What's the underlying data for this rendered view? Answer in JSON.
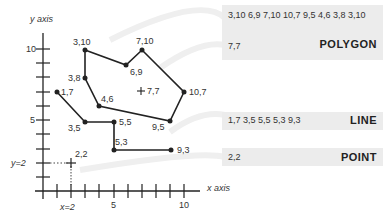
{
  "axes": {
    "x_label": "x axis",
    "y_label": "y axis",
    "x_ticks": [
      "5",
      "10"
    ],
    "y_ticks": [
      "5",
      "10"
    ],
    "x_guide_label": "x=2",
    "y_guide_label": "y=2"
  },
  "polygon": {
    "vertices": [
      [
        3,
        10
      ],
      [
        6,
        9
      ],
      [
        7,
        10
      ],
      [
        10,
        7
      ],
      [
        9,
        5
      ],
      [
        4,
        6
      ],
      [
        3,
        8
      ],
      [
        3,
        10
      ]
    ],
    "vertex_labels": [
      "3,10",
      "6,9",
      "7,10",
      "10,7",
      "9,5",
      "4,6",
      "3,8"
    ],
    "centroid": [
      7,
      7
    ],
    "centroid_label": "7,7",
    "panel": {
      "coords": "3,10 6,9 7,10 10,7 9,5 4,6 3,8 3,10",
      "centroid": "7,7",
      "title": "POLYGON"
    }
  },
  "line": {
    "vertices": [
      [
        1,
        7
      ],
      [
        3,
        5
      ],
      [
        5,
        5
      ],
      [
        5,
        3
      ],
      [
        9,
        3
      ]
    ],
    "vertex_labels": [
      "1,7",
      "3,5",
      "5,5",
      "5,3",
      "9,3"
    ],
    "panel": {
      "coords": "1,7 3,5 5,5 5,3 9,3",
      "title": "LINE"
    }
  },
  "point": {
    "location": [
      2,
      2
    ],
    "label": "2,2",
    "panel": {
      "coords": "2,2",
      "title": "POINT"
    }
  },
  "colors": {
    "stroke": "#222222",
    "panel_bg": "#ececec",
    "arc": "#eeeeee"
  }
}
